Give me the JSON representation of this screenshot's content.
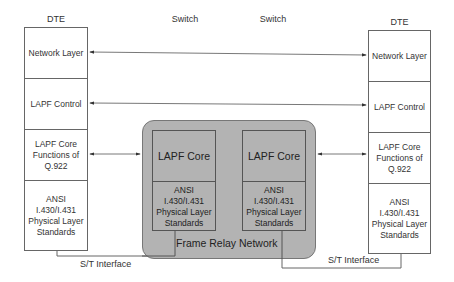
{
  "headers": {
    "left_dte": "DTE",
    "switch_left": "Switch",
    "switch_right": "Switch",
    "right_dte": "DTE"
  },
  "left_dte": {
    "layers": [
      "Network Layer",
      "LAPF Control",
      "LAPF Core Functions of Q.922",
      "ANSI I.430/I.431 Physical Layer Standards"
    ]
  },
  "right_dte": {
    "layers": [
      "Network Layer",
      "LAPF Control",
      "LAPF Core Functions of Q.922",
      "ANSI I.430/I.431 Physical Layer Standards"
    ]
  },
  "network": {
    "label": "Frame Relay Network",
    "fill_color": "#b3b3b3",
    "switches": [
      {
        "core": "LAPF Core",
        "physical": "ANSI I.430/I.431 Physical Layer Standards"
      },
      {
        "core": "LAPF Core",
        "physical": "ANSI I.430/I.431 Physical Layer Standards"
      }
    ]
  },
  "interfaces": {
    "left": "S/T Interface",
    "right": "S/T Interface"
  },
  "connections": [
    {
      "from": "left_dte.Network Layer",
      "to": "right_dte.Network Layer",
      "type": "bidirectional-arrow"
    },
    {
      "from": "left_dte.LAPF Control",
      "to": "right_dte.LAPF Control",
      "type": "bidirectional-arrow"
    },
    {
      "from": "left_dte.LAPF Core Functions",
      "to": "switch_left.LAPF Core",
      "type": "bidirectional-arrow"
    },
    {
      "from": "switch_right.LAPF Core",
      "to": "right_dte.LAPF Core Functions",
      "type": "bidirectional-arrow"
    }
  ]
}
